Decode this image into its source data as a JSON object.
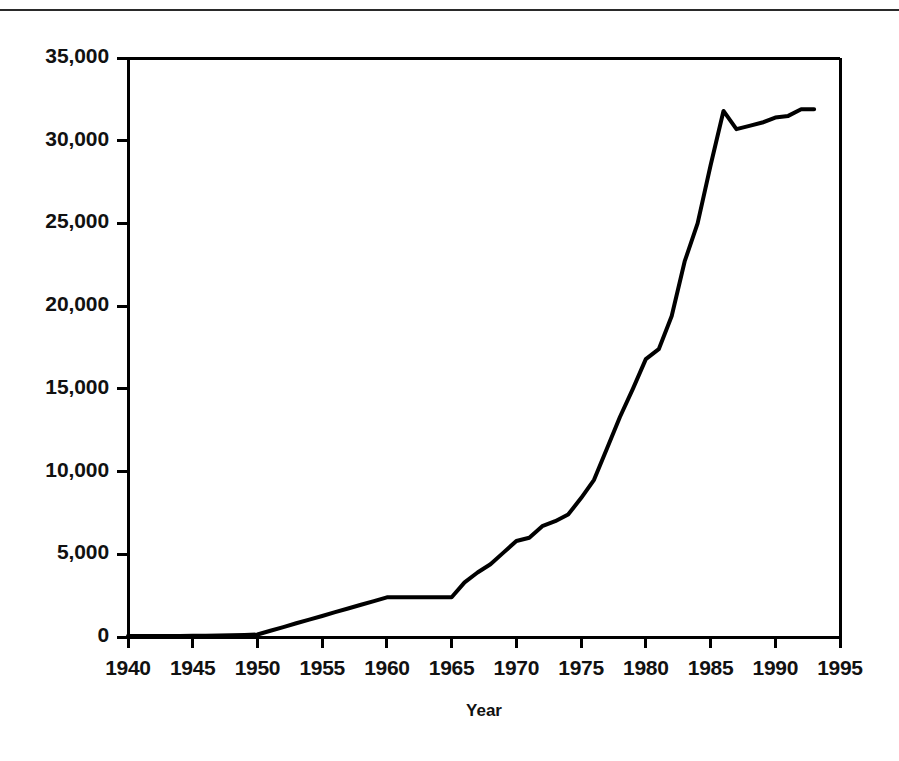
{
  "page": {
    "width": 899,
    "height": 761,
    "background": "#ffffff",
    "ink": "#000000"
  },
  "header": {
    "clipped_text": "",
    "rule_color": "#2a2a2a"
  },
  "axis": {
    "x_title": "Year",
    "y_title": "",
    "x_ticks": [
      "1940",
      "1945",
      "1950",
      "1955",
      "1960",
      "1965",
      "1970",
      "1975",
      "1980",
      "1985",
      "1990",
      "1995"
    ],
    "y_ticks": [
      "0",
      "5,000",
      "10,000",
      "15,000",
      "20,000",
      "25,000",
      "30,000",
      "35,000"
    ]
  },
  "chart_data": {
    "type": "line",
    "title": "",
    "xlabel": "Year",
    "ylabel": "",
    "xlim": [
      1940,
      1995
    ],
    "ylim": [
      0,
      35000
    ],
    "grid": false,
    "legend": "none",
    "line_color": "#000000",
    "line_width": 4,
    "x_tick_interval": 5,
    "y_tick_interval": 5000,
    "x": [
      1940,
      1941,
      1942,
      1943,
      1944,
      1945,
      1946,
      1947,
      1948,
      1949,
      1950,
      1951,
      1952,
      1953,
      1954,
      1955,
      1956,
      1957,
      1958,
      1959,
      1960,
      1961,
      1962,
      1963,
      1964,
      1965,
      1966,
      1967,
      1968,
      1969,
      1970,
      1971,
      1972,
      1973,
      1974,
      1975,
      1976,
      1977,
      1978,
      1979,
      1980,
      1981,
      1982,
      1983,
      1984,
      1985,
      1986,
      1987,
      1988,
      1989,
      1990,
      1991,
      1992,
      1993
    ],
    "values": [
      60,
      60,
      60,
      60,
      60,
      70,
      80,
      90,
      100,
      120,
      150,
      380,
      600,
      830,
      1050,
      1270,
      1500,
      1720,
      1950,
      2170,
      2400,
      2400,
      2400,
      2400,
      2400,
      2400,
      3300,
      3900,
      4400,
      5100,
      5800,
      6000,
      6700,
      7000,
      7400,
      8400,
      9500,
      11400,
      13300,
      15000,
      16800,
      17400,
      19400,
      22700,
      25000,
      28500,
      31800,
      30700,
      30900,
      31100,
      31400,
      31500,
      31900,
      31900
    ],
    "annotations": [
      {
        "label": "flat near zero through 1950",
        "x": 1945,
        "y": 70
      },
      {
        "label": "slope change",
        "x": 1965,
        "y": 2400
      },
      {
        "label": "peak",
        "x": 1986,
        "y": 31800
      },
      {
        "label": "dip",
        "x": 1987,
        "y": 30700
      },
      {
        "label": "series ends",
        "x": 1993,
        "y": 31900
      }
    ]
  },
  "geometry": {
    "plot_left": 128,
    "plot_right": 840,
    "plot_top": 58,
    "plot_bottom": 637,
    "tick_length": 11,
    "frame_width": 3
  }
}
